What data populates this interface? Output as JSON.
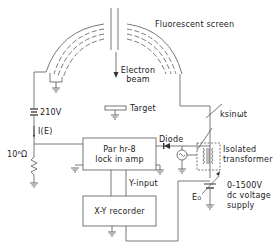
{
  "diagram": {
    "labels": {
      "fluorescent_screen": "Fluorescent screen",
      "electron_beam_line1": "Electron",
      "electron_beam_line2": "beam",
      "target": "Target",
      "voltage_210": "210V",
      "current": "I(E)",
      "resistor": "10⁶Ω",
      "diode": "Diode",
      "modulation": "ksinωt",
      "transformer_line1": "Isolated",
      "transformer_line2": "transformer",
      "lockin_line1": "Par hr-8",
      "lockin_line2": "lock in amp",
      "y_input": "Y-input",
      "recorder": "X-Y recorder",
      "e0": "E",
      "e0_sub": "O",
      "supply_line1": "0-1500V",
      "supply_line2": "dc voltage",
      "supply_line3": "supply"
    },
    "components": [
      {
        "name": "fluorescent-screen",
        "type": "hemispherical grids"
      },
      {
        "name": "electron-gun",
        "type": "beam source"
      },
      {
        "name": "target",
        "type": "sample"
      },
      {
        "name": "battery-210v",
        "value": "210V"
      },
      {
        "name": "resistor",
        "value": "10^6 Ω"
      },
      {
        "name": "lock-in-amplifier",
        "model": "Par hr-8"
      },
      {
        "name": "diode"
      },
      {
        "name": "ac-source",
        "signal": "ksinωt"
      },
      {
        "name": "isolated-transformer"
      },
      {
        "name": "dc-supply",
        "range": "0-1500V"
      },
      {
        "name": "xy-recorder"
      }
    ],
    "colors": {
      "line": "#555555",
      "text": "#222222",
      "background": "#ffffff"
    }
  }
}
